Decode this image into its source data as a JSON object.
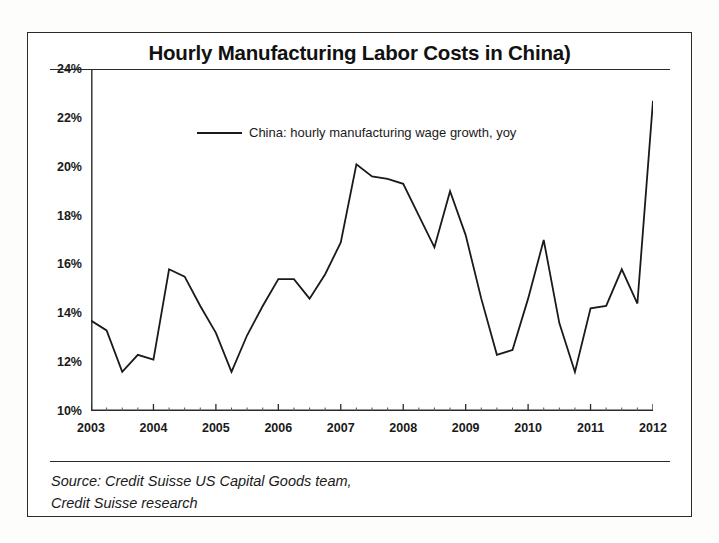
{
  "figure": {
    "title": "Hourly Manufacturing Labor Costs in China)",
    "source_lines": [
      "Source: Credit Suisse US Capital Goods team,",
      "Credit Suisse research"
    ]
  },
  "legend": {
    "position": "inside-top-left",
    "entries": [
      {
        "label": "China: hourly manufacturing wage growth, yoy",
        "color": "#1a1a1a"
      }
    ]
  },
  "axes": {
    "y_ticks": [
      "10%",
      "12%",
      "14%",
      "16%",
      "18%",
      "20%",
      "22%",
      "24%"
    ],
    "x_ticks": [
      "2003",
      "2004",
      "2005",
      "2006",
      "2007",
      "2008",
      "2009",
      "2010",
      "2011",
      "2012"
    ]
  },
  "chart_data": {
    "type": "line",
    "title": "Hourly Manufacturing Labor Costs in China)",
    "xlabel": "",
    "ylabel": "",
    "ylim": [
      10,
      24
    ],
    "ytick_values": [
      10,
      12,
      14,
      16,
      18,
      20,
      22,
      24
    ],
    "ytick_labels": [
      "10%",
      "12%",
      "14%",
      "16%",
      "18%",
      "20%",
      "22%",
      "24%"
    ],
    "xlim": [
      2003.0,
      2012.0
    ],
    "xtick_values": [
      2003,
      2004,
      2005,
      2006,
      2007,
      2008,
      2009,
      2010,
      2011,
      2012
    ],
    "xtick_labels": [
      "2003",
      "2004",
      "2005",
      "2006",
      "2007",
      "2008",
      "2009",
      "2010",
      "2011",
      "2012"
    ],
    "x_minor_ticks_per_interval": 4,
    "grid": false,
    "legend_position": "upper left inside",
    "units": "percent year-over-year",
    "series": [
      {
        "name": "China: hourly manufacturing wage growth, yoy",
        "color": "#1a1a1a",
        "line_width": 1.8,
        "x": [
          2003.0,
          2003.25,
          2003.5,
          2003.75,
          2004.0,
          2004.25,
          2004.5,
          2004.75,
          2005.0,
          2005.25,
          2005.5,
          2005.75,
          2006.0,
          2006.25,
          2006.5,
          2006.75,
          2007.0,
          2007.25,
          2007.5,
          2007.75,
          2008.0,
          2008.25,
          2008.5,
          2008.75,
          2009.0,
          2009.25,
          2009.5,
          2009.75,
          2010.0,
          2010.25,
          2010.5,
          2010.75,
          2011.0,
          2011.25,
          2011.5,
          2011.75,
          2012.0
        ],
        "y": [
          13.7,
          13.3,
          11.6,
          12.3,
          12.1,
          15.8,
          15.5,
          14.3,
          13.2,
          11.6,
          13.1,
          14.3,
          15.4,
          15.4,
          14.6,
          15.6,
          16.9,
          20.1,
          19.6,
          19.5,
          19.3,
          18.0,
          16.7,
          19.0,
          17.2,
          14.6,
          12.3,
          12.5,
          14.6,
          17.0,
          13.6,
          11.6,
          14.2,
          14.3,
          15.8,
          14.4,
          22.7
        ]
      }
    ]
  }
}
